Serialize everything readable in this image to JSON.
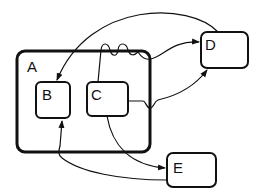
{
  "diagram": {
    "type": "statechart",
    "colors": {
      "ink": "#111111",
      "background": "#ffffff"
    },
    "states": [
      {
        "id": "A",
        "label": "A",
        "contains": [
          "B",
          "C"
        ]
      },
      {
        "id": "B",
        "label": "B"
      },
      {
        "id": "C",
        "label": "C"
      },
      {
        "id": "D",
        "label": "D"
      },
      {
        "id": "E",
        "label": "E"
      }
    ],
    "transitions": [
      {
        "from": "D",
        "to": "B"
      },
      {
        "from": "C",
        "to": "D",
        "via": "top edge of A"
      },
      {
        "from": "C",
        "to": "D",
        "via": "right side of C"
      },
      {
        "from": "C",
        "to": "E"
      },
      {
        "from": "E",
        "to": "B"
      }
    ]
  }
}
